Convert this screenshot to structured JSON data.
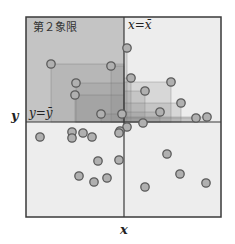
{
  "diagram": {
    "quadrant_label": "第２象限",
    "vline_label": "x=x̄",
    "hline_label": "y=ȳ",
    "axis_x_label": "x",
    "axis_y_label": "y",
    "colors": {
      "background": "#ffffff",
      "plot_bg": "#ededed",
      "quadrant2_bg": "#c4c4c4",
      "rect_fill": "#8a8a8a",
      "frame": "#3a3a3a",
      "point_fill": "#b0b0b0",
      "point_stroke": "#5a5a5a"
    },
    "frame": {
      "x0": 26,
      "y0": 17,
      "x1": 221,
      "y1": 217
    },
    "mean": {
      "x": 124,
      "y": 122
    },
    "points": [
      {
        "x": 51,
        "y": 64
      },
      {
        "x": 111,
        "y": 66
      },
      {
        "x": 127,
        "y": 48
      },
      {
        "x": 76,
        "y": 83
      },
      {
        "x": 75,
        "y": 95
      },
      {
        "x": 101,
        "y": 114
      },
      {
        "x": 122,
        "y": 114
      },
      {
        "x": 131,
        "y": 78
      },
      {
        "x": 171,
        "y": 82
      },
      {
        "x": 145,
        "y": 91
      },
      {
        "x": 181,
        "y": 103
      },
      {
        "x": 160,
        "y": 112
      },
      {
        "x": 196,
        "y": 118
      },
      {
        "x": 207,
        "y": 117
      },
      {
        "x": 143,
        "y": 123
      },
      {
        "x": 127,
        "y": 127
      },
      {
        "x": 120,
        "y": 131
      },
      {
        "x": 40,
        "y": 137
      },
      {
        "x": 72,
        "y": 132
      },
      {
        "x": 72,
        "y": 138
      },
      {
        "x": 83,
        "y": 133
      },
      {
        "x": 92,
        "y": 137
      },
      {
        "x": 119,
        "y": 133
      },
      {
        "x": 98,
        "y": 161
      },
      {
        "x": 119,
        "y": 160
      },
      {
        "x": 167,
        "y": 154
      },
      {
        "x": 79,
        "y": 176
      },
      {
        "x": 94,
        "y": 182
      },
      {
        "x": 107,
        "y": 178
      },
      {
        "x": 180,
        "y": 174
      },
      {
        "x": 145,
        "y": 187
      },
      {
        "x": 206,
        "y": 183
      }
    ]
  }
}
